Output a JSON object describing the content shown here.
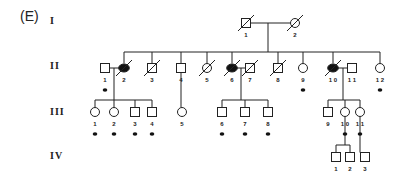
{
  "panel_label": "(E)",
  "generations": [
    {
      "label": "I",
      "members": [
        {
          "id": "I-1",
          "num": "1",
          "sex": "M",
          "affected": false,
          "deceased": true,
          "marker": false
        },
        {
          "id": "I-2",
          "num": "2",
          "sex": "F",
          "affected": false,
          "deceased": true,
          "marker": false
        }
      ]
    },
    {
      "label": "II",
      "members": [
        {
          "id": "II-1",
          "num": "1",
          "sex": "M",
          "affected": false,
          "deceased": false,
          "marker": true
        },
        {
          "id": "II-2",
          "num": "2",
          "sex": "F",
          "affected": true,
          "deceased": true,
          "marker": false
        },
        {
          "id": "II-3",
          "num": "3",
          "sex": "M",
          "affected": false,
          "deceased": true,
          "marker": false
        },
        {
          "id": "II-4",
          "num": "4",
          "sex": "M",
          "affected": false,
          "deceased": false,
          "marker": false
        },
        {
          "id": "II-5",
          "num": "5",
          "sex": "F",
          "affected": false,
          "deceased": true,
          "marker": false
        },
        {
          "id": "II-6",
          "num": "6",
          "sex": "F",
          "affected": true,
          "deceased": true,
          "marker": false
        },
        {
          "id": "II-7",
          "num": "7",
          "sex": "M",
          "affected": false,
          "deceased": true,
          "marker": false
        },
        {
          "id": "II-8",
          "num": "8",
          "sex": "M",
          "affected": false,
          "deceased": true,
          "marker": false
        },
        {
          "id": "II-9",
          "num": "9",
          "sex": "F",
          "affected": false,
          "deceased": false,
          "marker": true
        },
        {
          "id": "II-10",
          "num": "1 0",
          "sex": "F",
          "affected": true,
          "deceased": true,
          "marker": false
        },
        {
          "id": "II-11",
          "num": "1 1",
          "sex": "M",
          "affected": false,
          "deceased": false,
          "marker": false
        },
        {
          "id": "II-12",
          "num": "1 2",
          "sex": "F",
          "affected": false,
          "deceased": false,
          "marker": true
        }
      ]
    },
    {
      "label": "III",
      "members": [
        {
          "id": "III-1",
          "num": "1",
          "sex": "F",
          "affected": false,
          "deceased": false,
          "marker": true
        },
        {
          "id": "III-2",
          "num": "2",
          "sex": "F",
          "affected": false,
          "deceased": false,
          "marker": true
        },
        {
          "id": "III-3",
          "num": "3",
          "sex": "M",
          "affected": false,
          "deceased": false,
          "marker": true
        },
        {
          "id": "III-4",
          "num": "4",
          "sex": "M",
          "affected": false,
          "deceased": false,
          "marker": true
        },
        {
          "id": "III-5",
          "num": "5",
          "sex": "F",
          "affected": false,
          "deceased": false,
          "marker": false
        },
        {
          "id": "III-6",
          "num": "6",
          "sex": "M",
          "affected": false,
          "deceased": false,
          "marker": true
        },
        {
          "id": "III-7",
          "num": "7",
          "sex": "M",
          "affected": false,
          "deceased": false,
          "marker": true
        },
        {
          "id": "III-8",
          "num": "8",
          "sex": "M",
          "affected": false,
          "deceased": false,
          "marker": true
        },
        {
          "id": "III-9",
          "num": "9",
          "sex": "M",
          "affected": false,
          "deceased": false,
          "marker": false
        },
        {
          "id": "III-10",
          "num": "1 0",
          "sex": "F",
          "affected": false,
          "deceased": false,
          "marker": true
        },
        {
          "id": "III-11",
          "num": "1 1",
          "sex": "F",
          "affected": false,
          "deceased": false,
          "marker": true
        }
      ]
    },
    {
      "label": "IV",
      "members": [
        {
          "id": "IV-1",
          "num": "1",
          "sex": "M",
          "affected": false,
          "deceased": false,
          "marker": false
        },
        {
          "id": "IV-2",
          "num": "2",
          "sex": "M",
          "affected": false,
          "deceased": false,
          "marker": false
        },
        {
          "id": "IV-3",
          "num": "3",
          "sex": "M",
          "affected": false,
          "deceased": false,
          "marker": false
        }
      ]
    }
  ]
}
